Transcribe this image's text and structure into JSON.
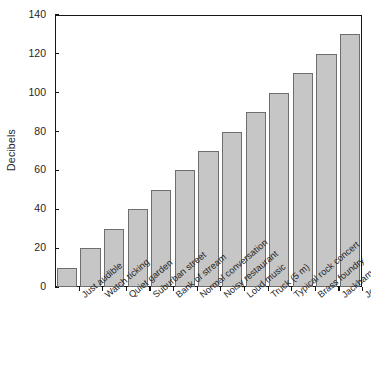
{
  "chart": {
    "type": "bar",
    "ylabel": "Decibels",
    "xlabel": "",
    "title": ""
  },
  "chart_data": {
    "type": "bar",
    "title": "",
    "subtitle": "",
    "xlabel": "",
    "ylabel": "Decibels",
    "categories": [
      "Just audible",
      "Watch ticking",
      "Quiet garden",
      "Suburban street",
      "Bank of stream",
      "Normal conversation",
      "Noisy restaurant",
      "Loud music",
      "Truck (5 m)",
      "Typical rock concert",
      "Brass foundry",
      "Jackhammer (1 m)",
      "Jet engine (30 m)"
    ],
    "values": [
      10,
      20,
      30,
      40,
      50,
      60,
      70,
      80,
      90,
      100,
      110,
      120,
      130
    ],
    "ylim": [
      0,
      140
    ],
    "ytick_labels": [
      "0",
      "20",
      "40",
      "60",
      "80",
      "100",
      "120",
      "140"
    ],
    "ytick_values": [
      0,
      20,
      40,
      60,
      80,
      100,
      120,
      140
    ],
    "grid": false,
    "legend": null,
    "legend_position": "none",
    "bar_fill_color": "#c6c6c6",
    "bar_edge_color": "#6e6e6e",
    "axis_color": "#151515",
    "background_color": "#ffffff"
  }
}
